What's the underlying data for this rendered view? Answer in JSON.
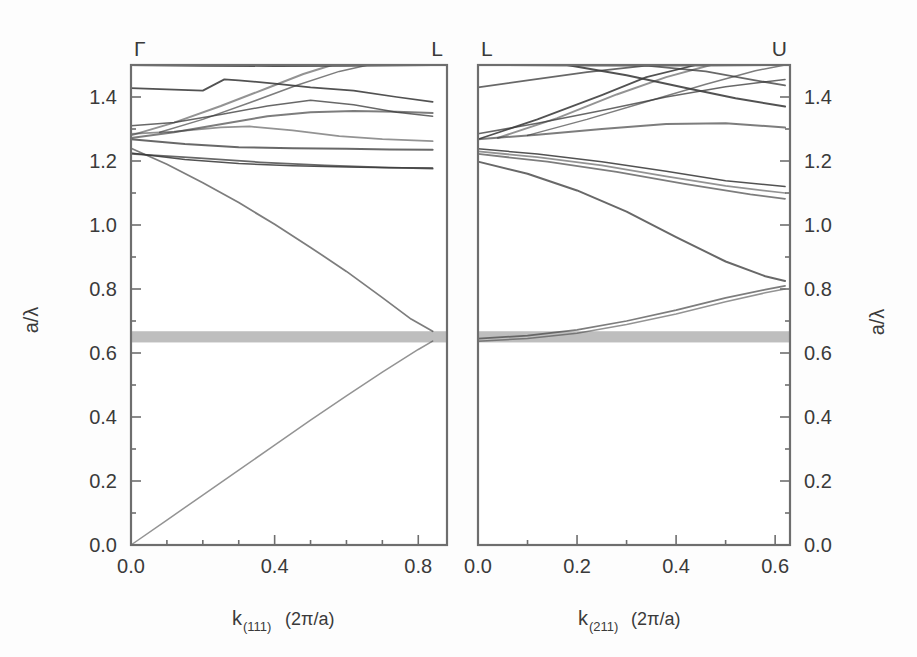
{
  "figure": {
    "background_color": "#fdfdfd",
    "line_color": "#3a3a3a",
    "frame_color": "#6e6e6e",
    "gap_fill_color": "#a8a8a8"
  },
  "chart_data": [
    {
      "type": "line",
      "panel": "left",
      "title": "",
      "xlabel": "k(111) (2π/a)",
      "xlabel_base": "k",
      "xlabel_sub": "(111)",
      "xlabel_unit": "(2π/a)",
      "ylabel": "a/λ",
      "xlim": [
        0.0,
        0.88
      ],
      "ylim": [
        0.0,
        1.5
      ],
      "xticks": [
        0.0,
        0.1,
        0.2,
        0.3,
        0.4,
        0.5,
        0.6,
        0.7,
        0.8
      ],
      "xticklabels": [
        "0.0",
        "",
        "",
        "",
        "0.4",
        "",
        "",
        "",
        "0.8"
      ],
      "yticks": [
        0.0,
        0.1,
        0.2,
        0.3,
        0.4,
        0.5,
        0.6,
        0.7,
        0.8,
        0.9,
        1.0,
        1.1,
        1.2,
        1.3,
        1.4,
        1.5
      ],
      "yticklabels": [
        "0.0",
        "",
        "0.2",
        "",
        "0.4",
        "",
        "0.6",
        "",
        "0.8",
        "",
        "1.0",
        "",
        "1.2",
        "",
        "1.4",
        ""
      ],
      "grid": false,
      "legend": "none",
      "symmetry_point_left": "Γ",
      "symmetry_point_right": "L",
      "band_gap": {
        "ymin": 0.633,
        "ymax": 0.668,
        "shaded": true
      },
      "series": [
        {
          "name": "band-1-acoustic-lower",
          "x": [
            0.0,
            0.1,
            0.2,
            0.3,
            0.4,
            0.5,
            0.6,
            0.7,
            0.8,
            0.84
          ],
          "values": [
            0.0,
            0.078,
            0.156,
            0.234,
            0.312,
            0.39,
            0.466,
            0.54,
            0.611,
            0.637
          ]
        },
        {
          "name": "band-2-upper-descending",
          "x": [
            0.0,
            0.1,
            0.2,
            0.3,
            0.4,
            0.5,
            0.6,
            0.7,
            0.78,
            0.84
          ],
          "values": [
            1.24,
            1.19,
            1.132,
            1.07,
            1.002,
            0.93,
            0.855,
            0.773,
            0.706,
            0.668
          ]
        },
        {
          "name": "band-3-flat-1.235",
          "x": [
            0.0,
            0.15,
            0.3,
            0.45,
            0.6,
            0.72,
            0.84
          ],
          "values": [
            1.268,
            1.253,
            1.243,
            1.24,
            1.238,
            1.236,
            1.235
          ]
        },
        {
          "name": "band-4-flat-1.18",
          "x": [
            0.0,
            0.15,
            0.3,
            0.45,
            0.6,
            0.72,
            0.84
          ],
          "values": [
            1.225,
            1.205,
            1.192,
            1.185,
            1.181,
            1.179,
            1.178
          ]
        },
        {
          "name": "band-5-hump-1.30",
          "x": [
            0.0,
            0.12,
            0.25,
            0.33,
            0.45,
            0.58,
            0.7,
            0.84
          ],
          "values": [
            1.285,
            1.292,
            1.305,
            1.308,
            1.296,
            1.278,
            1.268,
            1.262
          ]
        },
        {
          "name": "band-6-rising-to-1.35",
          "x": [
            0.0,
            0.12,
            0.25,
            0.38,
            0.5,
            0.62,
            0.74,
            0.84
          ],
          "values": [
            1.272,
            1.29,
            1.315,
            1.34,
            1.352,
            1.356,
            1.354,
            1.35
          ]
        },
        {
          "name": "band-7-from-1.31",
          "x": [
            0.0,
            0.12,
            0.25,
            0.38,
            0.5,
            0.62,
            0.74,
            0.84
          ],
          "values": [
            1.31,
            1.32,
            1.345,
            1.372,
            1.39,
            1.376,
            1.352,
            1.34
          ]
        },
        {
          "name": "band-8-kinked-1.42",
          "x": [
            0.0,
            0.1,
            0.2,
            0.26,
            0.3,
            0.4,
            0.5,
            0.62,
            0.74,
            0.84
          ],
          "values": [
            1.428,
            1.424,
            1.42,
            1.455,
            1.452,
            1.442,
            1.43,
            1.42,
            1.4,
            1.385
          ]
        },
        {
          "name": "band-9-steep-rising",
          "x": [
            0.0,
            0.12,
            0.25,
            0.38,
            0.48,
            0.56
          ],
          "values": [
            1.28,
            1.32,
            1.372,
            1.428,
            1.472,
            1.5
          ]
        },
        {
          "name": "band-10-steep-rising-b",
          "x": [
            0.08,
            0.2,
            0.33,
            0.46,
            0.58,
            0.66
          ],
          "values": [
            1.29,
            1.33,
            1.382,
            1.436,
            1.48,
            1.5
          ]
        },
        {
          "name": "band-11-faint-1.24",
          "x": [
            0.0,
            0.18,
            0.36,
            0.54,
            0.7,
            0.84
          ],
          "values": [
            1.222,
            1.21,
            1.196,
            1.186,
            1.18,
            1.176
          ]
        },
        {
          "name": "band-12-top-edge",
          "x": [
            0.0,
            0.2,
            0.4,
            0.6,
            0.84
          ],
          "values": [
            1.5,
            1.498,
            1.497,
            1.498,
            1.5
          ]
        }
      ]
    },
    {
      "type": "line",
      "panel": "right",
      "title": "",
      "xlabel": "k(211) (2π/a)",
      "xlabel_base": "k",
      "xlabel_sub": "(211)",
      "xlabel_unit": "(2π/a)",
      "ylabel": "a/λ",
      "xlim": [
        0.0,
        0.63
      ],
      "ylim": [
        0.0,
        1.5
      ],
      "xticks": [
        0.0,
        0.1,
        0.2,
        0.3,
        0.4,
        0.5,
        0.6
      ],
      "xticklabels": [
        "0.0",
        "",
        "0.2",
        "",
        "0.4",
        "",
        "0.6"
      ],
      "yticks": [
        0.0,
        0.1,
        0.2,
        0.3,
        0.4,
        0.5,
        0.6,
        0.7,
        0.8,
        0.9,
        1.0,
        1.1,
        1.2,
        1.3,
        1.4,
        1.5
      ],
      "yticklabels": [
        "0.0",
        "",
        "0.2",
        "",
        "0.4",
        "",
        "0.6",
        "",
        "0.8",
        "",
        "1.0",
        "",
        "1.2",
        "",
        "1.4",
        ""
      ],
      "grid": false,
      "legend": "none",
      "symmetry_point_left": "L",
      "symmetry_point_right": "U",
      "band_gap": {
        "ymin": 0.633,
        "ymax": 0.668,
        "shaded": true
      },
      "series": [
        {
          "name": "band-1-lower-rising",
          "x": [
            0.0,
            0.1,
            0.2,
            0.3,
            0.4,
            0.5,
            0.58,
            0.62
          ],
          "values": [
            0.637,
            0.645,
            0.662,
            0.689,
            0.722,
            0.76,
            0.788,
            0.8
          ]
        },
        {
          "name": "band-2-lower-rising-b",
          "x": [
            0.0,
            0.1,
            0.2,
            0.3,
            0.4,
            0.5,
            0.58,
            0.62
          ],
          "values": [
            0.645,
            0.654,
            0.672,
            0.7,
            0.734,
            0.772,
            0.798,
            0.81
          ]
        },
        {
          "name": "band-3-descend-to-0.83",
          "x": [
            0.0,
            0.1,
            0.2,
            0.3,
            0.4,
            0.5,
            0.58,
            0.62
          ],
          "values": [
            1.198,
            1.16,
            1.108,
            1.042,
            0.962,
            0.886,
            0.84,
            0.825
          ]
        },
        {
          "name": "band-4-flat-to-1.12",
          "x": [
            0.0,
            0.12,
            0.25,
            0.38,
            0.5,
            0.62
          ],
          "values": [
            1.238,
            1.222,
            1.198,
            1.168,
            1.138,
            1.12
          ]
        },
        {
          "name": "band-5-flat-to-1.10",
          "x": [
            0.0,
            0.12,
            0.25,
            0.38,
            0.5,
            0.62
          ],
          "values": [
            1.23,
            1.212,
            1.186,
            1.152,
            1.122,
            1.1
          ]
        },
        {
          "name": "band-6-gentle-to-1.30",
          "x": [
            0.0,
            0.12,
            0.25,
            0.38,
            0.5,
            0.62
          ],
          "values": [
            1.268,
            1.282,
            1.3,
            1.316,
            1.318,
            1.305
          ]
        },
        {
          "name": "band-7-rise-to-1.44",
          "x": [
            0.0,
            0.12,
            0.25,
            0.38,
            0.5,
            0.62
          ],
          "values": [
            1.285,
            1.318,
            1.358,
            1.4,
            1.432,
            1.455
          ]
        },
        {
          "name": "band-8-rise-steep",
          "x": [
            0.0,
            0.12,
            0.25,
            0.34,
            0.44
          ],
          "values": [
            1.268,
            1.33,
            1.406,
            1.462,
            1.5
          ]
        },
        {
          "name": "band-9-rise-steep-b",
          "x": [
            0.04,
            0.16,
            0.28,
            0.38,
            0.47
          ],
          "values": [
            1.272,
            1.334,
            1.408,
            1.462,
            1.5
          ]
        },
        {
          "name": "band-10-rise-steep-c",
          "x": [
            0.1,
            0.22,
            0.34,
            0.46,
            0.56,
            0.62
          ],
          "values": [
            1.28,
            1.33,
            1.385,
            1.44,
            1.482,
            1.5
          ]
        },
        {
          "name": "band-11-descend-from-top",
          "x": [
            0.0,
            0.1,
            0.22,
            0.34,
            0.46,
            0.56,
            0.62
          ],
          "values": [
            1.43,
            1.452,
            1.478,
            1.498,
            1.48,
            1.452,
            1.436
          ]
        },
        {
          "name": "band-12-cross-descending",
          "x": [
            0.18,
            0.3,
            0.42,
            0.52,
            0.62
          ],
          "values": [
            1.5,
            1.468,
            1.428,
            1.396,
            1.37
          ]
        },
        {
          "name": "band-13-top-edge",
          "x": [
            0.0,
            0.16,
            0.32,
            0.48,
            0.62
          ],
          "values": [
            1.5,
            1.498,
            1.497,
            1.498,
            1.5
          ]
        },
        {
          "name": "band-14-faint-low",
          "x": [
            0.0,
            0.14,
            0.28,
            0.42,
            0.55,
            0.62
          ],
          "values": [
            1.222,
            1.198,
            1.166,
            1.128,
            1.096,
            1.082
          ]
        }
      ]
    }
  ],
  "axes": {
    "y_label": "a/λ",
    "y_ticklabels": [
      "1.4",
      "1.2",
      "1.0",
      "0.8",
      "0.6",
      "0.4",
      "0.2",
      "0.0"
    ],
    "left_panel": {
      "symbol_left": "Γ",
      "symbol_right": "L",
      "x_ticklabels": [
        "0.0",
        "0.4",
        "0.8"
      ],
      "x_title_base": "k",
      "x_title_sub": "(111)",
      "x_title_unit": "(2π/a)"
    },
    "right_panel": {
      "symbol_left": "L",
      "symbol_right": "U",
      "x_ticklabels": [
        "0.0",
        "0.2",
        "0.4",
        "0.6"
      ],
      "x_title_base": "k",
      "x_title_sub": "(211)",
      "x_title_unit": "(2π/a)"
    }
  }
}
